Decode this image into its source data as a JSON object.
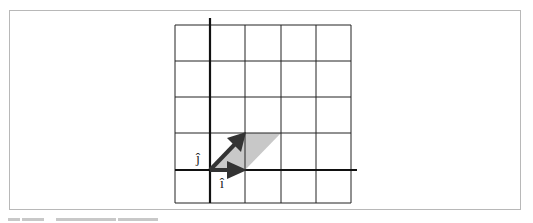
{
  "figure": {
    "type": "linear-algebra-basis-vectors",
    "grid": {
      "columns": 5,
      "rows": 5,
      "line_color": "#222222"
    },
    "axes": {
      "color": "#111111"
    },
    "vectors": [
      {
        "name": "i_hat",
        "label": "î",
        "from": [
          0,
          0
        ],
        "to": [
          1,
          0
        ],
        "color": "#333333"
      },
      {
        "name": "j_hat",
        "label": "ĵ",
        "from": [
          0,
          0
        ],
        "to": [
          1,
          1
        ],
        "color": "#333333"
      }
    ],
    "parallelogram": {
      "fill": "#c8c8c8",
      "vertices": [
        [
          0,
          0
        ],
        [
          1,
          0
        ],
        [
          2,
          1
        ],
        [
          1,
          1
        ]
      ]
    },
    "labels": {
      "i_hat": "î",
      "j_hat": "ĵ"
    }
  },
  "caption": {
    "visible": "partially cut off"
  }
}
